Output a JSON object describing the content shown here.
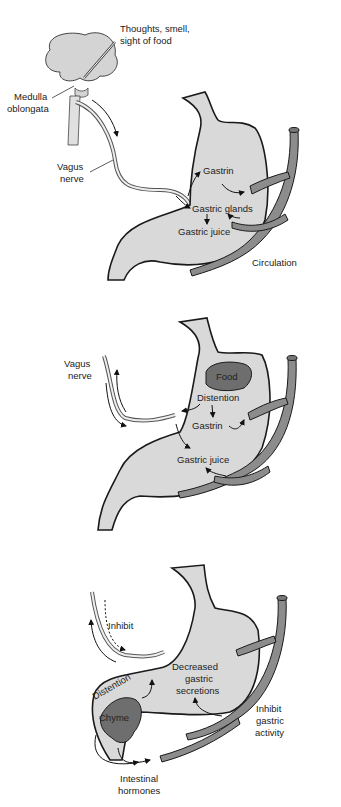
{
  "panels": [
    {
      "name": "cephalic-phase",
      "labels": {
        "stimulus": "Thoughts, smell,",
        "stimulus2": "sight of food",
        "medulla": "Medulla",
        "medulla2": "oblongata",
        "vagus": "Vagus",
        "vagus2": "nerve",
        "gastrin": "Gastrin",
        "glands": "Gastric glands",
        "juice": "Gastric juice",
        "circulation": "Circulation"
      }
    },
    {
      "name": "gastric-phase",
      "labels": {
        "vagus": "Vagus",
        "vagus2": "nerve",
        "food": "Food",
        "distention": "Distention",
        "gastrin": "Gastrin",
        "juice": "Gastric juice"
      }
    },
    {
      "name": "intestinal-phase",
      "labels": {
        "inhibit": "Inhibit",
        "decreased": "Decreased",
        "decreased2": "gastric",
        "decreased3": "secretions",
        "distention": "Distention",
        "chyme": "Chyme",
        "inhibit_activity": "Inhibit",
        "inhibit_activity2": "gastric",
        "inhibit_activity3": "activity",
        "hormones": "Intestinal",
        "hormones2": "hormones"
      }
    }
  ]
}
